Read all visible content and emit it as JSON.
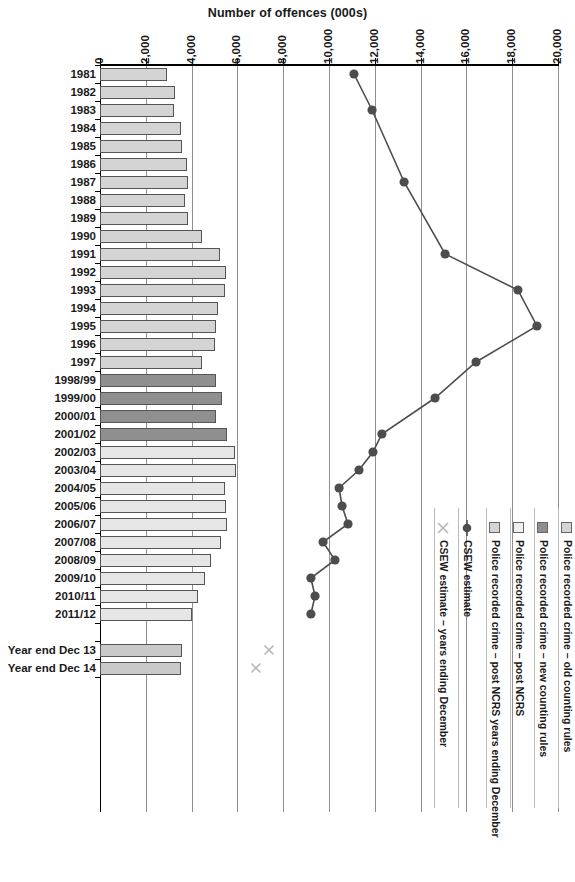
{
  "chart_data": {
    "type": "bar",
    "title": "Number of offences (000s)",
    "xlabel": "Number of offences (000s)",
    "ylabel": "",
    "xlim": [
      0,
      20000
    ],
    "xticks": [
      0,
      2000,
      4000,
      6000,
      8000,
      10000,
      12000,
      14000,
      16000,
      18000,
      20000
    ],
    "xtick_labels": [
      "0",
      "2,000",
      "4,000",
      "6,000",
      "8,000",
      "10,000",
      "12,000",
      "14,000",
      "16,000",
      "18,000",
      "20,000"
    ],
    "grid": true,
    "orientation": "horizontal",
    "legend_position": "right",
    "categories": [
      "1981",
      "1982",
      "1983",
      "1984",
      "1985",
      "1986",
      "1987",
      "1988",
      "1989",
      "1990",
      "1991",
      "1992",
      "1993",
      "1994",
      "1995",
      "1996",
      "1997",
      "1998/99",
      "1999/00",
      "2000/01",
      "2001/02",
      "2002/03",
      "2003/04",
      "2004/05",
      "2005/06",
      "2006/07",
      "2007/08",
      "2008/09",
      "2009/10",
      "2010/11",
      "2011/12",
      "",
      "Year end Dec 13",
      "Year end Dec 14"
    ],
    "series": [
      {
        "name": "Police recorded crime – old counting rules",
        "style": "bar",
        "fill": "#d4d4d4",
        "values": [
          2930,
          3270,
          3230,
          3540,
          3580,
          3800,
          3840,
          3710,
          3840,
          4450,
          5240,
          5500,
          5460,
          5160,
          5060,
          5020,
          4450,
          null,
          null,
          null,
          null,
          null,
          null,
          null,
          null,
          null,
          null,
          null,
          null,
          null,
          null,
          null,
          null,
          null
        ]
      },
      {
        "name": "Police recorded crime – new counting rules",
        "style": "bar",
        "fill": "#8f8f8f",
        "values": [
          null,
          null,
          null,
          null,
          null,
          null,
          null,
          null,
          null,
          null,
          null,
          null,
          null,
          null,
          null,
          null,
          null,
          5060,
          5330,
          5060,
          5550,
          null,
          null,
          null,
          null,
          null,
          null,
          null,
          null,
          null,
          null,
          null,
          null,
          null
        ]
      },
      {
        "name": "Police recorded crime – post NCRS",
        "style": "bar",
        "fill": "#e6e6e6",
        "values": [
          null,
          null,
          null,
          null,
          null,
          null,
          null,
          null,
          null,
          null,
          null,
          null,
          null,
          null,
          null,
          null,
          null,
          null,
          null,
          null,
          null,
          5890,
          5930,
          5460,
          5500,
          5550,
          5280,
          4850,
          4590,
          4280,
          4020,
          null,
          null,
          null
        ]
      },
      {
        "name": "Police recorded crime – post NCRS years ending December",
        "style": "bar",
        "fill": "#c9c9c9",
        "values": [
          null,
          null,
          null,
          null,
          null,
          null,
          null,
          null,
          null,
          null,
          null,
          null,
          null,
          null,
          null,
          null,
          null,
          null,
          null,
          null,
          null,
          null,
          null,
          null,
          null,
          null,
          null,
          null,
          null,
          null,
          null,
          null,
          3580,
          3540
        ]
      },
      {
        "name": "CSEW estimate",
        "style": "line-marker",
        "color": "#4d4d4d",
        "values": [
          11090,
          null,
          11880,
          null,
          null,
          null,
          13280,
          null,
          null,
          null,
          15070,
          null,
          18250,
          null,
          19080,
          null,
          16420,
          null,
          14630,
          null,
          12310,
          11920,
          11310,
          10440,
          10570,
          10830,
          9740,
          10260,
          9210,
          9390,
          9210,
          null,
          null,
          null
        ]
      },
      {
        "name": "CSEW estimate – years ending December",
        "style": "cross-marker",
        "color": "#b6b6b6",
        "values": [
          null,
          null,
          null,
          null,
          null,
          null,
          null,
          null,
          null,
          null,
          null,
          null,
          null,
          null,
          null,
          null,
          null,
          null,
          null,
          null,
          null,
          null,
          null,
          null,
          null,
          null,
          null,
          null,
          null,
          null,
          null,
          null,
          7380,
          6810
        ]
      }
    ]
  },
  "legend": {
    "items": [
      {
        "label": "Police recorded crime – old counting rules",
        "marker": "swatch",
        "color": "#d4d4d4"
      },
      {
        "label": "Police recorded crime – new counting rules",
        "marker": "swatch",
        "color": "#8f8f8f"
      },
      {
        "label": "Police recorded crime – post NCRS",
        "marker": "swatch",
        "color": "#f0f0f0"
      },
      {
        "label": "Police recorded crime – post NCRS years ending December",
        "marker": "swatch",
        "color": "#d4d4d4"
      },
      {
        "label": "CSEW estimate",
        "marker": "dot",
        "color": "#4d4d4d"
      },
      {
        "label": "CSEW estimate – years ending December",
        "marker": "cross",
        "color": "#b6b6b6"
      }
    ]
  }
}
